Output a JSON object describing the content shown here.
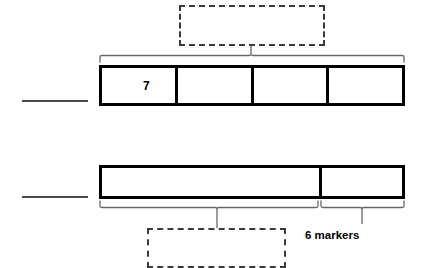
{
  "diagram": {
    "type": "tape-diagram",
    "title": "",
    "colors": {
      "stroke": "#000000",
      "dashed_stroke": "#3a3a3a",
      "brace_stroke": "#555555",
      "background": "#ffffff",
      "text": "#000000"
    },
    "bars": [
      {
        "id": "top-bar",
        "name": "top-tape-bar",
        "segments": 4,
        "cells": [
          {
            "value": "7"
          },
          {
            "value": ""
          },
          {
            "value": ""
          },
          {
            "value": ""
          }
        ],
        "brace": {
          "position": "above",
          "spans_whole_bar": true,
          "label": ""
        },
        "answer_blank": ""
      },
      {
        "id": "bottom-bar",
        "name": "bottom-tape-bar",
        "segments": 2,
        "cells": [
          {
            "value": ""
          },
          {
            "value": ""
          }
        ],
        "braces": [
          {
            "position": "below",
            "covers": "left-segment",
            "label": ""
          },
          {
            "position": "below",
            "covers": "right-segment",
            "label": "6 markers"
          }
        ],
        "answer_blank": ""
      }
    ],
    "dashed_boxes": [
      {
        "id": "top",
        "name": "top-answer-box",
        "text": ""
      },
      {
        "id": "bottom",
        "name": "bottom-answer-box",
        "text": ""
      }
    ],
    "labels": {
      "six_markers": "6 markers"
    },
    "answer_lines": [
      {
        "id": "top",
        "value": ""
      },
      {
        "id": "bottom",
        "value": ""
      }
    ]
  }
}
